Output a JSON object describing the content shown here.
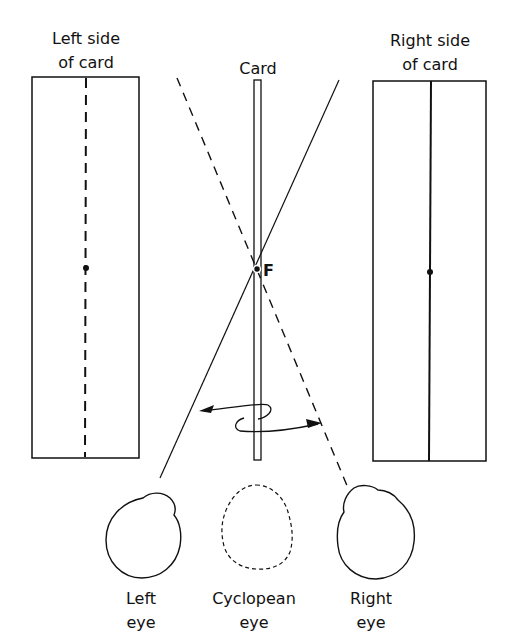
{
  "labels": {
    "left_side": [
      "Left side",
      "of card"
    ],
    "right_side": [
      "Right side",
      "of card"
    ],
    "card": "Card",
    "fixation": "F",
    "left_eye": [
      "Left",
      "eye"
    ],
    "cyclopean_eye": [
      "Cyclopean",
      "eye"
    ],
    "right_eye": [
      "Right",
      "eye"
    ]
  },
  "colors": {
    "ink": "#111111",
    "background": "#ffffff"
  }
}
